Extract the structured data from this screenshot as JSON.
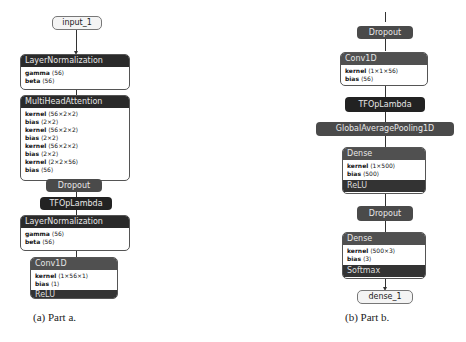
{
  "part_a": {
    "caption": "(a) Part a.",
    "input": "input_1",
    "layernorm1": {
      "title": "LayerNormalization",
      "params": [
        {
          "name": "gamma",
          "shape": "⟨56⟩"
        },
        {
          "name": "beta",
          "shape": "⟨56⟩"
        }
      ]
    },
    "mha": {
      "title": "MultiHeadAttention",
      "params": [
        {
          "name": "kernel",
          "shape": "⟨56×2×2⟩"
        },
        {
          "name": "bias",
          "shape": "⟨2×2⟩"
        },
        {
          "name": "kernel",
          "shape": "⟨56×2×2⟩"
        },
        {
          "name": "bias",
          "shape": "⟨2×2⟩"
        },
        {
          "name": "kernel",
          "shape": "⟨56×2×2⟩"
        },
        {
          "name": "bias",
          "shape": "⟨2×2⟩"
        },
        {
          "name": "kernel",
          "shape": "⟨2×2×56⟩"
        },
        {
          "name": "bias",
          "shape": "⟨56⟩"
        }
      ]
    },
    "dropout": "Dropout",
    "tfop": "TFOpLambda",
    "layernorm2": {
      "title": "LayerNormalization",
      "params": [
        {
          "name": "gamma",
          "shape": "⟨56⟩"
        },
        {
          "name": "beta",
          "shape": "⟨56⟩"
        }
      ]
    },
    "conv1d": {
      "title": "Conv1D",
      "params": [
        {
          "name": "kernel",
          "shape": "⟨1×56×1⟩"
        },
        {
          "name": "bias",
          "shape": "⟨1⟩"
        }
      ],
      "activation": "ReLU"
    }
  },
  "part_b": {
    "caption": "(b) Part b.",
    "dropout1": "Dropout",
    "conv1d": {
      "title": "Conv1D",
      "params": [
        {
          "name": "kernel",
          "shape": "⟨1×1×56⟩"
        },
        {
          "name": "bias",
          "shape": "⟨56⟩"
        }
      ]
    },
    "tfop": "TFOpLambda",
    "gap": "GlobalAveragePooling1D",
    "dense1": {
      "title": "Dense",
      "params": [
        {
          "name": "kernel",
          "shape": "⟨1×500⟩"
        },
        {
          "name": "bias",
          "shape": "⟨500⟩"
        }
      ],
      "activation": "ReLU"
    },
    "dropout2": "Dropout",
    "dense2": {
      "title": "Dense",
      "params": [
        {
          "name": "kernel",
          "shape": "⟨500×3⟩"
        },
        {
          "name": "bias",
          "shape": "⟨3⟩"
        }
      ],
      "activation": "Softmax"
    },
    "output": "dense_1"
  }
}
